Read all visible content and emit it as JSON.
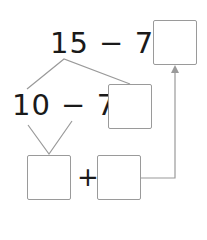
{
  "equation_top": {
    "text": "15 − 7 ="
  },
  "equation_middle": {
    "text": "10 − 7 +"
  },
  "plus_bottom": {
    "text": "+"
  },
  "boxes": {
    "result": {
      "value": ""
    },
    "middle": {
      "value": ""
    },
    "bottom_left": {
      "value": ""
    },
    "bottom_right": {
      "value": ""
    }
  },
  "colors": {
    "text": "#1a1a1a",
    "lines": "#9a9a9a"
  }
}
